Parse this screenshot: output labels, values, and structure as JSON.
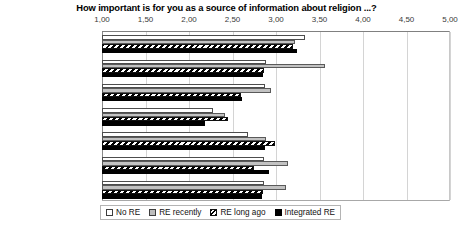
{
  "chart_data": {
    "type": "bar",
    "orientation": "horizontal",
    "title": "How important is for you as a source of information about religion ...?",
    "xlabel": "",
    "ylabel": "",
    "xlim": [
      1.0,
      5.0
    ],
    "xticks": [
      "1,00",
      "1,50",
      "2,00",
      "2,50",
      "3,00",
      "3,50",
      "4,00",
      "4,50",
      "5,00"
    ],
    "xtick_values": [
      1.0,
      1.5,
      2.0,
      2.5,
      3.0,
      3.5,
      4.0,
      4.5,
      5.0
    ],
    "grid": true,
    "legend_position": "bottom",
    "decimal_separator": ",",
    "categories": [
      "family",
      "school",
      "friends",
      "religious community",
      "books",
      "media",
      "Internet"
    ],
    "series": [
      {
        "name": "No RE",
        "fill": "white",
        "color": "#ffffff",
        "values": [
          3.33,
          2.89,
          2.87,
          2.28,
          2.68,
          2.86,
          2.86
        ]
      },
      {
        "name": "RE recently",
        "fill": "gray",
        "color": "#c2c2c2",
        "values": [
          3.22,
          3.56,
          2.94,
          2.41,
          2.89,
          3.14,
          3.12
        ]
      },
      {
        "name": "RE long ago",
        "fill": "hatched",
        "color": "#ffffff",
        "values": [
          3.2,
          2.86,
          2.6,
          2.45,
          2.99,
          2.75,
          2.85
        ]
      },
      {
        "name": "Integrated RE",
        "fill": "black",
        "color": "#000000",
        "values": [
          3.24,
          2.85,
          2.61,
          2.18,
          2.87,
          2.92,
          2.84
        ]
      }
    ]
  }
}
